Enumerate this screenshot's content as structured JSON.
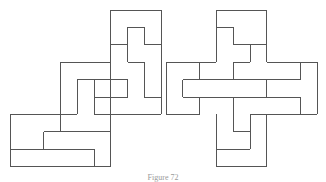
{
  "figure": {
    "caption": "Figure 72",
    "stroke_color": "#555555",
    "grid": {
      "unit_x": 16.8,
      "unit_y": 17.4,
      "origin_y": 10
    },
    "left_figure": {
      "name": "dissection-left",
      "origin_x": 10,
      "segments": [
        [
          6,
          0,
          9,
          0
        ],
        [
          6,
          0,
          6,
          6
        ],
        [
          9,
          0,
          9,
          6
        ],
        [
          6,
          2,
          7,
          2
        ],
        [
          7,
          1,
          8,
          1
        ],
        [
          7,
          1,
          7,
          3
        ],
        [
          8,
          1,
          8,
          2
        ],
        [
          8,
          2,
          9,
          2
        ],
        [
          7,
          3,
          8,
          3
        ],
        [
          8,
          3,
          8,
          5
        ],
        [
          8,
          5,
          9,
          5
        ],
        [
          3,
          3,
          6,
          3
        ],
        [
          3,
          3,
          3,
          7
        ],
        [
          4,
          4,
          6,
          4
        ],
        [
          4,
          4,
          4,
          6
        ],
        [
          5,
          4,
          5,
          6
        ],
        [
          5,
          5,
          7,
          5
        ],
        [
          7,
          4,
          7,
          5
        ],
        [
          7,
          4,
          6,
          4
        ],
        [
          5,
          6,
          9,
          6
        ],
        [
          0,
          6,
          4,
          6
        ],
        [
          0,
          6,
          0,
          9
        ],
        [
          6,
          6,
          6,
          9
        ],
        [
          2,
          7,
          6,
          7
        ],
        [
          2,
          7,
          2,
          8
        ],
        [
          3,
          6,
          3,
          7
        ],
        [
          0,
          8,
          5,
          8
        ],
        [
          5,
          8,
          5,
          9
        ],
        [
          0,
          9,
          6,
          9
        ]
      ]
    },
    "right_figure": {
      "name": "dissection-right",
      "origin_x": 166,
      "segments": [
        [
          3,
          0,
          6,
          0
        ],
        [
          3,
          0,
          3,
          3
        ],
        [
          6,
          0,
          6,
          3
        ],
        [
          3,
          1,
          4,
          1
        ],
        [
          4,
          1,
          4,
          2
        ],
        [
          4,
          2,
          6,
          2
        ],
        [
          5,
          2,
          5,
          3
        ],
        [
          4,
          3,
          5,
          3
        ],
        [
          4,
          3,
          4,
          4
        ],
        [
          0,
          3,
          3,
          3
        ],
        [
          0,
          3,
          0,
          6
        ],
        [
          2,
          3,
          2,
          4
        ],
        [
          6,
          3,
          9,
          3
        ],
        [
          8,
          3,
          8,
          4
        ],
        [
          9,
          3,
          9,
          6
        ],
        [
          1,
          4,
          8,
          4
        ],
        [
          1,
          4,
          1,
          5
        ],
        [
          6,
          4,
          6,
          5
        ],
        [
          1,
          5,
          8,
          5
        ],
        [
          8,
          5,
          8,
          6
        ],
        [
          0,
          6,
          2,
          6
        ],
        [
          2,
          5,
          2,
          6
        ],
        [
          4,
          5,
          4,
          7
        ],
        [
          4,
          7,
          5,
          7
        ],
        [
          5,
          6,
          5,
          8
        ],
        [
          5,
          6,
          9,
          6
        ],
        [
          3,
          6,
          3,
          9
        ],
        [
          6,
          6,
          6,
          9
        ],
        [
          3,
          8,
          5,
          8
        ],
        [
          3,
          9,
          6,
          9
        ]
      ]
    }
  }
}
